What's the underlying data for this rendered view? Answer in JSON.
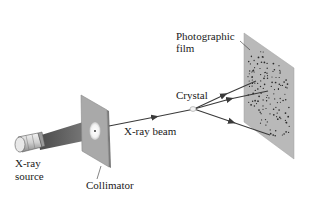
{
  "diagram": {
    "labels": {
      "source_line1": "X-ray",
      "source_line2": "source",
      "collimator": "Collimator",
      "beam": "X-ray beam",
      "crystal": "Crystal",
      "film_line1": "Photographic",
      "film_line2": "film"
    },
    "components": [
      {
        "id": "xray-source",
        "icon": "cylinder-tube"
      },
      {
        "id": "collimator",
        "icon": "plate-with-pinhole"
      },
      {
        "id": "crystal",
        "icon": "small-crystal"
      },
      {
        "id": "photographic-film",
        "icon": "plate-with-diffraction-spots"
      }
    ],
    "diffracted_rays": 3,
    "colors": {
      "plate": "#b9b9b9",
      "plate_edge": "#8e8e8e",
      "ray": "#444444",
      "spot": "#2a2a2a",
      "text": "#1a1a1a"
    }
  }
}
